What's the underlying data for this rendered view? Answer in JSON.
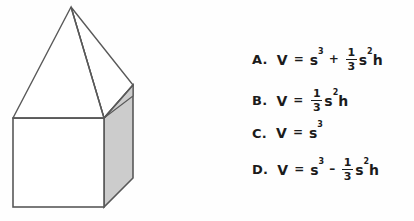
{
  "figure": {
    "name": "cube-with-square-pyramid-on-top",
    "fill_front": "#ffffff",
    "fill_side": "#cccccc",
    "stroke": "#595959",
    "geometry": {
      "apex": [
        71,
        7
      ],
      "front_top_left": [
        13,
        118
      ],
      "front_top_right": [
        104,
        118
      ],
      "back_top_right": [
        133,
        85
      ],
      "front_bottom_left": [
        13,
        207
      ],
      "front_bottom_right": [
        104,
        207
      ],
      "back_bottom_right": [
        133,
        178
      ]
    }
  },
  "answers": {
    "choices": [
      {
        "label": "A.",
        "variable": "V",
        "equals": "=",
        "base": "s",
        "base_exp": "3",
        "operator": "+",
        "fraction_numerator": "1",
        "fraction_denominator": "3",
        "tail_base": "s",
        "tail_exp": "2",
        "tail_var": "h",
        "text": "V = s³ + 1/3 s²h",
        "top": 47
      },
      {
        "label": "B.",
        "variable": "V",
        "equals": "=",
        "base": "",
        "base_exp": "",
        "operator": "",
        "fraction_numerator": "1",
        "fraction_denominator": "3",
        "tail_base": "s",
        "tail_exp": "2",
        "tail_var": "h",
        "text": "V = 1/3 s²h",
        "top": 88
      },
      {
        "label": "C.",
        "variable": "V",
        "equals": "=",
        "base": "s",
        "base_exp": "3",
        "operator": "",
        "fraction_numerator": "",
        "fraction_denominator": "",
        "tail_base": "",
        "tail_exp": "",
        "tail_var": "",
        "text": "V = s³",
        "top": 125
      },
      {
        "label": "D.",
        "variable": "V",
        "equals": "=",
        "base": "s",
        "base_exp": "3",
        "operator": "–",
        "fraction_numerator": "1",
        "fraction_denominator": "3",
        "tail_base": "s",
        "tail_exp": "2",
        "tail_var": "h",
        "text": "V = s³ – 1/3 s²h",
        "top": 157
      }
    ]
  }
}
